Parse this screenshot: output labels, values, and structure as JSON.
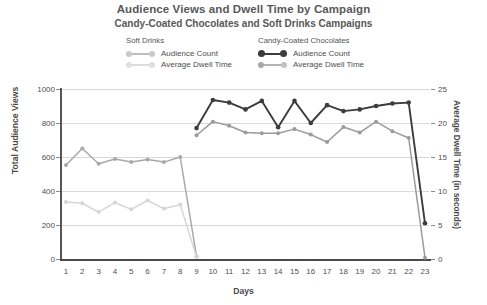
{
  "header": {
    "title": "Audience Views and Dwell Time by Campaign",
    "subtitle": "Candy-Coated Chocolates and Soft Drinks Campaigns"
  },
  "legend": {
    "groups": [
      {
        "heading": "Soft Drinks",
        "entries": [
          {
            "label": "Audience Count",
            "color": "#a9a9a9"
          },
          {
            "label": "Average Dwell Time",
            "color": "#d6d6d6"
          }
        ]
      },
      {
        "heading": "Candy-Coated Chocolates",
        "entries": [
          {
            "label": "Audience Count",
            "color": "#3c3c3c"
          },
          {
            "label": "Average Dwell Time",
            "color": "#9b9b9b"
          }
        ]
      }
    ]
  },
  "chart_data": {
    "type": "line",
    "title": "Audience Views and Dwell Time by Campaign",
    "subtitle": "Candy-Coated Chocolates and Soft Drinks Campaigns",
    "xlabel": "Days",
    "ylabel": "Total Audience Views",
    "y2label": "Average Dwell Time (in seconds)",
    "x": [
      1,
      2,
      3,
      4,
      5,
      6,
      7,
      8,
      9,
      10,
      11,
      12,
      13,
      14,
      15,
      16,
      17,
      18,
      19,
      20,
      21,
      22,
      23
    ],
    "xticklabels": [
      "1",
      "2",
      "3",
      "4",
      "5",
      "6",
      "7",
      "8",
      "9",
      "10",
      "11",
      "12",
      "13",
      "14",
      "15",
      "16",
      "17",
      "18",
      "19",
      "20",
      "21",
      "22",
      "23"
    ],
    "ylim": [
      0,
      1000
    ],
    "yticks": [
      0,
      200,
      400,
      600,
      800,
      1000
    ],
    "yticklabels": [
      "0",
      "200",
      "400",
      "600",
      "800",
      "1000"
    ],
    "y2lim": [
      0,
      25
    ],
    "y2ticks": [
      0,
      5,
      10,
      15,
      20,
      25
    ],
    "y2ticklabels": [
      "0",
      "5",
      "10",
      "15",
      "20",
      "25"
    ],
    "grid": true,
    "legend_position": "top",
    "series": [
      {
        "name": "Soft Drinks Audience Count",
        "axis": "left",
        "color": "#a9a9a9",
        "x": [
          1,
          2,
          3,
          4,
          5,
          6,
          7,
          8,
          9
        ],
        "values": [
          553,
          650,
          560,
          588,
          570,
          585,
          570,
          600,
          15
        ]
      },
      {
        "name": "Soft Drinks Average Dwell Time",
        "axis": "right",
        "color": "#d6d6d6",
        "x": [
          1,
          2,
          3,
          4,
          5,
          6,
          7,
          8,
          9
        ],
        "values": [
          8.4,
          8.2,
          6.9,
          8.3,
          7.3,
          8.6,
          7.4,
          8.0,
          0.3
        ]
      },
      {
        "name": "Candy-Coated Chocolates Audience Count",
        "axis": "left",
        "color": "#3c3c3c",
        "x": [
          9,
          10,
          11,
          12,
          13,
          14,
          15,
          16,
          17,
          18,
          19,
          20,
          21,
          22,
          23
        ],
        "values": [
          770,
          935,
          920,
          880,
          930,
          775,
          930,
          800,
          905,
          870,
          880,
          900,
          915,
          920,
          210
        ]
      },
      {
        "name": "Candy-Coated Chocolates Average Dwell Time",
        "axis": "right",
        "color": "#9b9b9b",
        "x": [
          9,
          10,
          11,
          12,
          13,
          14,
          15,
          16,
          17,
          18,
          19,
          20,
          21,
          22,
          23
        ],
        "values": [
          18.2,
          20.2,
          19.6,
          18.6,
          18.5,
          18.5,
          19.1,
          18.3,
          17.2,
          19.4,
          18.6,
          20.2,
          18.8,
          17.8,
          0.2
        ]
      }
    ]
  }
}
